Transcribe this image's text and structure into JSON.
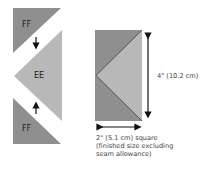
{
  "diagram": {
    "pieces": [
      {
        "id": "top-ff",
        "label": "FF",
        "color": "#8f8f8f"
      },
      {
        "id": "center-ee",
        "label": "EE",
        "color": "#b8b8b8"
      },
      {
        "id": "bottom-ff",
        "label": "FF",
        "color": "#8f8f8f"
      }
    ],
    "assembled": {
      "outer_color": "#8f8f8f",
      "inner_color": "#b8b8b8",
      "height_label": "4\" (10.2 cm)",
      "width_label_lines": [
        "2\" (5.1 cm) square",
        "(finished size excluding",
        "seam allowance)"
      ]
    }
  }
}
